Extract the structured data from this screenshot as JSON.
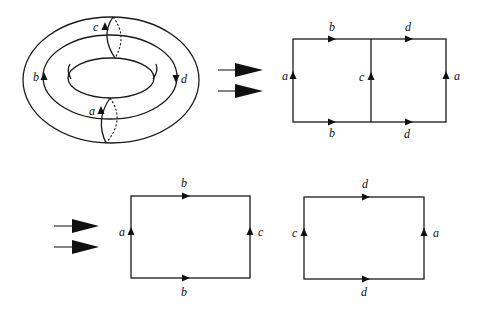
{
  "figure": {
    "colors": {
      "ink": "#111111",
      "background": "#ffffff"
    }
  },
  "torus": {
    "labels": {
      "meridian_top": "c",
      "meridian_bottom": "a",
      "longitude_left": "b",
      "longitude_right": "d"
    }
  },
  "arrows": {
    "first_transition": "double-arrow",
    "second_transition": "double-arrow"
  },
  "combined_rectangle": {
    "top_left": "b",
    "top_right": "d",
    "bottom_left": "b",
    "bottom_right": "d",
    "left": "a",
    "middle": "c",
    "right": "a"
  },
  "rect_left": {
    "top": "b",
    "bottom": "b",
    "left": "a",
    "right": "c"
  },
  "rect_right": {
    "top": "d",
    "bottom": "d",
    "left": "c",
    "right": "a"
  }
}
